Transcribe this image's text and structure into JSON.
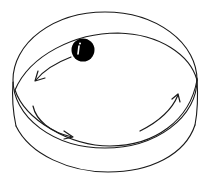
{
  "diagram": {
    "title": "",
    "colors": {
      "line": "#1a1a1a",
      "ball": "#000000",
      "highlight": "#ffffff",
      "background": "#ffffff"
    },
    "elements": [
      {
        "name": "cylinder-track",
        "kind": "cylinder"
      },
      {
        "name": "ball",
        "kind": "sphere"
      },
      {
        "name": "motion-arrow",
        "direction": "counterclockwise"
      },
      {
        "name": "motion-arrow",
        "direction": "counterclockwise"
      },
      {
        "name": "motion-arrow",
        "direction": "counterclockwise"
      }
    ]
  }
}
